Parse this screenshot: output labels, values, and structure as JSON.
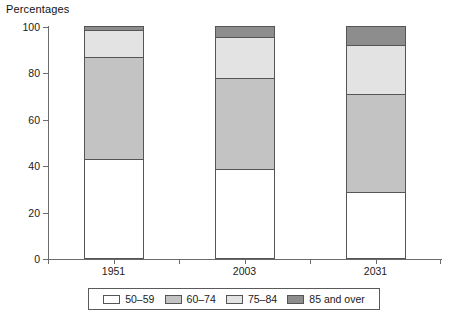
{
  "chart_data": {
    "type": "bar",
    "subtype": "stacked-percentage",
    "title": "Percentages",
    "xlabel": "",
    "ylabel": "",
    "ylim": [
      0,
      100
    ],
    "yticks": [
      0,
      20,
      40,
      60,
      80,
      100
    ],
    "ytick_labels": [
      "0",
      "20",
      "40",
      "60",
      "80",
      "100"
    ],
    "grid": false,
    "legend_position": "bottom",
    "categories": [
      "1951",
      "2003",
      "2031"
    ],
    "series": [
      {
        "name": "50–59",
        "color": "#ffffff",
        "values": [
          42.7,
          38.4,
          28.4
        ]
      },
      {
        "name": "60–74",
        "color": "#c3c3c3",
        "values": [
          43.9,
          39.2,
          42.3
        ]
      },
      {
        "name": "75–84",
        "color": "#e3e3e3",
        "values": [
          11.7,
          17.7,
          21.1
        ]
      },
      {
        "name": "85 and over",
        "color": "#8d8d8d",
        "values": [
          1.7,
          4.7,
          8.2
        ]
      }
    ],
    "cumulative_tops": [
      [
        42.7,
        86.6,
        98.3,
        100.0
      ],
      [
        38.4,
        77.6,
        95.3,
        100.0
      ],
      [
        28.4,
        70.7,
        91.8,
        100.0
      ]
    ]
  },
  "legend": {
    "items": [
      {
        "label": "50–59",
        "color": "#ffffff"
      },
      {
        "label": "60–74",
        "color": "#c3c3c3"
      },
      {
        "label": "75–84",
        "color": "#e3e3e3"
      },
      {
        "label": "85 and over",
        "color": "#8d8d8d"
      }
    ]
  }
}
